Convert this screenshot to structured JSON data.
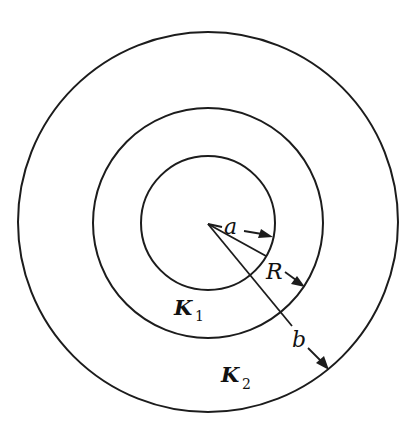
{
  "diagram": {
    "title": "",
    "center": {
      "x": 208,
      "y": 223
    },
    "circles": [
      {
        "id": "inner",
        "r": 66
      },
      {
        "id": "middle",
        "r": 115
      },
      {
        "id": "outer",
        "r": 190
      }
    ],
    "regions": [
      {
        "id": "K1",
        "base": "K",
        "sub": "1"
      },
      {
        "id": "K2",
        "base": "K",
        "sub": "2"
      }
    ],
    "radii_labels": {
      "a": "a",
      "R": "R",
      "b": "b"
    },
    "colors": {
      "stroke": "#1c1c1c",
      "background": "#ffffff"
    }
  }
}
